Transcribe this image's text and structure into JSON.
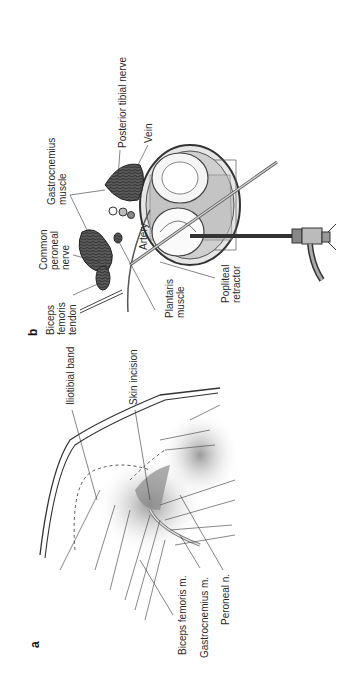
{
  "figure": {
    "orientation": "rotated -90deg",
    "panel_b": {
      "letter": "b",
      "labels": {
        "biceps_femoris_tendon": "Biceps\nfemoris\ntendon",
        "common_peroneal_nerve": "Common\nperoneal\nnerve",
        "gastrocnemius_muscle": "Gastrocnemius\nmuscle",
        "posterior_tibial_nerve": "Posterior tibial nerve",
        "vein": "Vein",
        "artery": "Artery",
        "plantaris_muscle": "Plantaris\nmuscle",
        "popliteal_retractor": "Popliteal\nretractor"
      }
    },
    "panel_a": {
      "letter": "a",
      "labels": {
        "iliotibial_band": "Iliotibial band",
        "skin_incision": "Skin incision",
        "biceps_femoris_m": "Biceps femoris m.",
        "gastrocnemius_m": "Gastrocnemius m.",
        "peroneal_n": "Peroneal n."
      }
    }
  }
}
